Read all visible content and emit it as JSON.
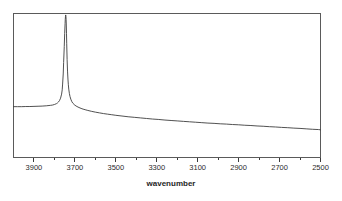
{
  "chart_data": {
    "type": "line",
    "title": "",
    "subtitle": "",
    "xlabel": "wavenumber",
    "ylabel": "",
    "xlim": [
      4000,
      2500
    ],
    "ylim": [
      0,
      100
    ],
    "x_axis_reversed": true,
    "grid": false,
    "legend": null,
    "legend_position": "none",
    "x_tick_labels": [
      "3900",
      "3700",
      "3500",
      "3300",
      "3100",
      "2900",
      "2700",
      "2500"
    ],
    "x_tick_values": [
      3900,
      3700,
      3500,
      3300,
      3100,
      2900,
      2700,
      2500
    ],
    "x_minor_tick_values": [
      3800,
      3600,
      3400,
      3200,
      3000,
      2800,
      2600
    ],
    "y_tick_labels": [],
    "annotations": [
      {
        "label": "sharp O-H stretch peak",
        "x": 3745,
        "y": 98
      }
    ],
    "series": [
      {
        "name": "transmittance",
        "color": "#3d3d3d",
        "x": [
          4000,
          3980,
          3960,
          3940,
          3920,
          3900,
          3880,
          3860,
          3840,
          3820,
          3810,
          3800,
          3790,
          3785,
          3780,
          3775,
          3770,
          3765,
          3762,
          3760,
          3757,
          3755,
          3752,
          3750,
          3748,
          3747,
          3746,
          3745,
          3744,
          3743,
          3742,
          3741,
          3740,
          3738,
          3736,
          3734,
          3732,
          3730,
          3727,
          3724,
          3720,
          3715,
          3710,
          3700,
          3690,
          3680,
          3670,
          3660,
          3650,
          3640,
          3620,
          3600,
          3580,
          3560,
          3540,
          3520,
          3500,
          3470,
          3440,
          3410,
          3380,
          3350,
          3320,
          3290,
          3260,
          3230,
          3200,
          3170,
          3140,
          3110,
          3080,
          3050,
          3020,
          2990,
          2960,
          2930,
          2900,
          2870,
          2840,
          2810,
          2780,
          2750,
          2720,
          2690,
          2660,
          2630,
          2600,
          2570,
          2540,
          2510,
          2500
        ],
        "y": [
          35.3,
          35.3,
          35.3,
          35.4,
          35.4,
          35.5,
          35.6,
          35.7,
          35.9,
          36.2,
          36.4,
          36.8,
          37.4,
          37.9,
          38.6,
          39.6,
          41.2,
          44.0,
          47.0,
          51.0,
          58.0,
          66.0,
          77.0,
          86.0,
          93.0,
          96.0,
          98.0,
          99.0,
          98.2,
          96.0,
          92.0,
          86.0,
          79.0,
          68.0,
          60.0,
          54.5,
          50.5,
          47.5,
          44.5,
          42.4,
          40.5,
          38.8,
          37.7,
          36.3,
          35.4,
          34.7,
          34.1,
          33.6,
          33.2,
          32.8,
          32.1,
          31.5,
          31.0,
          30.5,
          30.1,
          29.7,
          29.3,
          28.8,
          28.3,
          27.9,
          27.5,
          27.1,
          26.7,
          26.4,
          26.0,
          25.7,
          25.4,
          25.1,
          24.8,
          24.5,
          24.2,
          23.9,
          23.7,
          23.4,
          23.2,
          22.9,
          22.7,
          22.4,
          22.2,
          21.9,
          21.7,
          21.4,
          21.2,
          20.9,
          20.7,
          20.4,
          20.2,
          19.9,
          19.6,
          19.4,
          19.2
        ]
      }
    ]
  },
  "axis": {
    "x_title": "wavenumber"
  }
}
